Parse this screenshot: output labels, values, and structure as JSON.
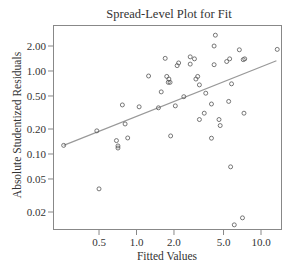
{
  "chart_data": {
    "type": "scatter",
    "title": "Spread-Level Plot for Fit",
    "xlabel": "Fitted Values",
    "ylabel": "Absolute Studentized Residuals",
    "x_scale": "log",
    "y_scale": "log",
    "x_ticks": [
      0.5,
      1.0,
      2.0,
      5.0,
      10.0
    ],
    "x_tick_labels": [
      "0.5",
      "1.0",
      "2.0",
      "5.0",
      "10.0"
    ],
    "y_ticks": [
      0.02,
      0.05,
      0.1,
      0.2,
      0.5,
      1.0,
      2.0
    ],
    "y_tick_labels": [
      "0.02",
      "0.05",
      "0.10",
      "0.20",
      "0.50",
      "1.00",
      "2.00"
    ],
    "xlim": [
      0.25,
      15.0
    ],
    "ylim": [
      0.012,
      3.3
    ],
    "grid": false,
    "legend": null,
    "fit_line": {
      "x": [
        0.26,
        13.3
      ],
      "y": [
        0.127,
        1.33
      ]
    },
    "points": [
      {
        "x": 0.26,
        "y": 0.127
      },
      {
        "x": 0.48,
        "y": 0.19
      },
      {
        "x": 0.5,
        "y": 0.038
      },
      {
        "x": 0.69,
        "y": 0.145
      },
      {
        "x": 0.71,
        "y": 0.125
      },
      {
        "x": 0.71,
        "y": 0.118
      },
      {
        "x": 0.77,
        "y": 0.39
      },
      {
        "x": 0.81,
        "y": 0.23
      },
      {
        "x": 0.85,
        "y": 0.156
      },
      {
        "x": 1.05,
        "y": 0.37
      },
      {
        "x": 1.25,
        "y": 0.87
      },
      {
        "x": 1.5,
        "y": 0.36
      },
      {
        "x": 1.58,
        "y": 0.56
      },
      {
        "x": 1.7,
        "y": 1.42
      },
      {
        "x": 1.75,
        "y": 0.86
      },
      {
        "x": 1.8,
        "y": 0.73
      },
      {
        "x": 1.82,
        "y": 0.8
      },
      {
        "x": 1.86,
        "y": 0.73
      },
      {
        "x": 1.88,
        "y": 0.165
      },
      {
        "x": 2.12,
        "y": 1.16
      },
      {
        "x": 2.18,
        "y": 1.25
      },
      {
        "x": 2.05,
        "y": 0.38
      },
      {
        "x": 2.4,
        "y": 0.49
      },
      {
        "x": 2.7,
        "y": 1.48
      },
      {
        "x": 2.92,
        "y": 1.4
      },
      {
        "x": 2.7,
        "y": 1.21
      },
      {
        "x": 3.1,
        "y": 0.86
      },
      {
        "x": 3.0,
        "y": 0.8
      },
      {
        "x": 3.2,
        "y": 0.68
      },
      {
        "x": 3.6,
        "y": 0.54
      },
      {
        "x": 3.2,
        "y": 0.26
      },
      {
        "x": 3.5,
        "y": 0.31
      },
      {
        "x": 4.0,
        "y": 0.4
      },
      {
        "x": 4.3,
        "y": 2.7
      },
      {
        "x": 4.2,
        "y": 2.0
      },
      {
        "x": 4.0,
        "y": 0.155
      },
      {
        "x": 4.6,
        "y": 0.26
      },
      {
        "x": 4.2,
        "y": 1.19
      },
      {
        "x": 4.7,
        "y": 0.22
      },
      {
        "x": 5.3,
        "y": 1.3
      },
      {
        "x": 5.6,
        "y": 1.4
      },
      {
        "x": 5.5,
        "y": 0.43
      },
      {
        "x": 5.8,
        "y": 0.7
      },
      {
        "x": 5.7,
        "y": 0.07
      },
      {
        "x": 6.7,
        "y": 1.8
      },
      {
        "x": 7.2,
        "y": 1.37
      },
      {
        "x": 7.4,
        "y": 1.4
      },
      {
        "x": 7.3,
        "y": 0.31
      },
      {
        "x": 6.1,
        "y": 0.014
      },
      {
        "x": 7.1,
        "y": 0.017
      },
      {
        "x": 13.5,
        "y": 1.82
      }
    ]
  }
}
